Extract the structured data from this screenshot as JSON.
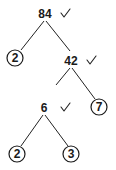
{
  "diagram": {
    "type": "factor-tree",
    "root": "84",
    "nodes": [
      {
        "id": "n84",
        "label": "84",
        "prime": false,
        "checked": true
      },
      {
        "id": "n2a",
        "label": "2",
        "prime": true,
        "checked": false
      },
      {
        "id": "n42",
        "label": "42",
        "prime": false,
        "checked": true
      },
      {
        "id": "n6",
        "label": "6",
        "prime": false,
        "checked": true
      },
      {
        "id": "n7",
        "label": "7",
        "prime": true,
        "checked": false
      },
      {
        "id": "n2b",
        "label": "2",
        "prime": true,
        "checked": false
      },
      {
        "id": "n3",
        "label": "3",
        "prime": true,
        "checked": false
      }
    ],
    "edges": [
      {
        "from": "n84",
        "to": "n2a"
      },
      {
        "from": "n84",
        "to": "n42"
      },
      {
        "from": "n42",
        "to": "n6"
      },
      {
        "from": "n42",
        "to": "n7"
      },
      {
        "from": "n6",
        "to": "n2b"
      },
      {
        "from": "n6",
        "to": "n3"
      }
    ],
    "check_icon": "checkmark-icon",
    "prime_marker": "circle-outline"
  }
}
